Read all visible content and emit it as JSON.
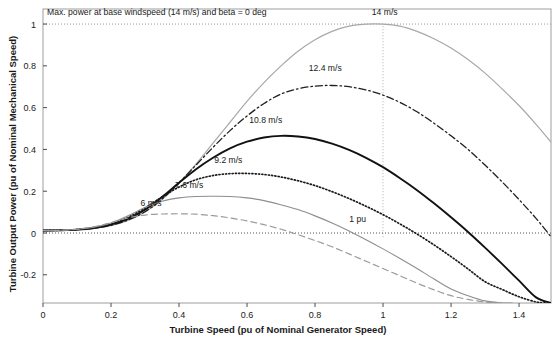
{
  "chart_data": {
    "type": "line",
    "title": "",
    "xlabel": "Turbine Speed (pu of Nominal Generator Speed)",
    "ylabel": "Turbine Output Power (pu of Nominal Mechanical Speed)",
    "xlim": [
      0,
      1.494
    ],
    "ylim": [
      -0.335,
      1.072
    ],
    "xticks": [
      0,
      0.2,
      0.4,
      0.6,
      0.8,
      1,
      1.2,
      1.4
    ],
    "xticklabels": [
      "0",
      "0.2",
      "0.4",
      "0.6",
      "0.8",
      "1",
      "1.2",
      "1.4"
    ],
    "yticks": [
      -0.2,
      0,
      0.2,
      0.4,
      0.6,
      0.8,
      1
    ],
    "yticklabels": [
      "-0.2",
      "0",
      "0.2",
      "0.4",
      "0.6",
      "0.8",
      "1"
    ],
    "grid": false,
    "legend_position": "inline-curve-labels",
    "annotations": [
      {
        "name": "max-power-note",
        "text": "Max. power at base windspeed (14 m/s) and beta = 0 deg",
        "x": 0.012,
        "y": 1.045,
        "anchor": "start"
      },
      {
        "name": "one-pu-note",
        "text": "1 pu",
        "x": 0.95,
        "y": 0.055,
        "anchor": "end"
      }
    ],
    "reference_lines": [
      {
        "name": "max-power-hline",
        "orientation": "horizontal",
        "value": 1.0,
        "style": "dotted",
        "color": "#9a9a9a"
      },
      {
        "name": "base-speed-vline",
        "orientation": "vertical",
        "value": 1.0,
        "style": "dotted",
        "color": "#b0b0b0",
        "y_from": -0.02,
        "y_to": 1.0
      },
      {
        "name": "zero-power-hline",
        "orientation": "horizontal",
        "value": 0.0,
        "style": "dotted",
        "color": "#555555"
      }
    ],
    "series": [
      {
        "name": "14 m/s",
        "label": "14 m/s",
        "label_x": 1.005,
        "label_y": 1.045,
        "color": "#a8a8a8",
        "style": "solid",
        "width": 1.2,
        "peak_x": 1.0,
        "peak_y": 1.0,
        "x": [
          0,
          0.05,
          0.1,
          0.15,
          0.2,
          0.25,
          0.3,
          0.35,
          0.4,
          0.45,
          0.5,
          0.55,
          0.6,
          0.65,
          0.7,
          0.75,
          0.8,
          0.85,
          0.9,
          0.95,
          1.0,
          1.05,
          1.1,
          1.15,
          1.2,
          1.25,
          1.3,
          1.35,
          1.4,
          1.45,
          1.494
        ],
        "y": [
          0.012,
          0.013,
          0.016,
          0.022,
          0.035,
          0.06,
          0.1,
          0.16,
          0.24,
          0.33,
          0.43,
          0.53,
          0.63,
          0.72,
          0.8,
          0.87,
          0.925,
          0.965,
          0.99,
          1.0,
          1.0,
          0.99,
          0.965,
          0.93,
          0.885,
          0.83,
          0.765,
          0.69,
          0.61,
          0.52,
          0.435
        ]
      },
      {
        "name": "12.4 m/s",
        "label": "12.4 m/s",
        "label_x": 0.83,
        "label_y": 0.775,
        "color": "#1f1f1f",
        "style": "dashdot",
        "width": 1.3,
        "peak_x": 0.875,
        "peak_y": 0.705,
        "x": [
          0,
          0.05,
          0.1,
          0.15,
          0.2,
          0.25,
          0.3,
          0.35,
          0.4,
          0.45,
          0.5,
          0.55,
          0.6,
          0.65,
          0.7,
          0.75,
          0.8,
          0.85,
          0.9,
          0.95,
          1.0,
          1.05,
          1.1,
          1.15,
          1.2,
          1.25,
          1.3,
          1.35,
          1.4,
          1.45,
          1.494
        ],
        "y": [
          0.012,
          0.013,
          0.016,
          0.023,
          0.037,
          0.062,
          0.102,
          0.162,
          0.24,
          0.325,
          0.41,
          0.49,
          0.56,
          0.62,
          0.665,
          0.69,
          0.703,
          0.706,
          0.7,
          0.685,
          0.66,
          0.625,
          0.58,
          0.525,
          0.465,
          0.4,
          0.325,
          0.245,
          0.16,
          0.07,
          -0.018
        ]
      },
      {
        "name": "10.8 m/s",
        "label": "10.8 m/s",
        "label_x": 0.655,
        "label_y": 0.525,
        "color": "#111111",
        "style": "solid",
        "width": 1.9,
        "peak_x": 0.72,
        "peak_y": 0.465,
        "x": [
          0,
          0.05,
          0.1,
          0.15,
          0.2,
          0.25,
          0.3,
          0.35,
          0.4,
          0.45,
          0.5,
          0.55,
          0.6,
          0.65,
          0.7,
          0.75,
          0.8,
          0.85,
          0.9,
          0.95,
          1.0,
          1.05,
          1.1,
          1.15,
          1.2,
          1.25,
          1.3,
          1.35,
          1.4,
          1.45,
          1.494
        ],
        "y": [
          0.012,
          0.013,
          0.016,
          0.024,
          0.04,
          0.068,
          0.112,
          0.172,
          0.24,
          0.305,
          0.36,
          0.405,
          0.437,
          0.457,
          0.465,
          0.462,
          0.45,
          0.428,
          0.398,
          0.36,
          0.315,
          0.262,
          0.205,
          0.142,
          0.075,
          0.005,
          -0.07,
          -0.148,
          -0.228,
          -0.308,
          -0.335
        ]
      },
      {
        "name": "9.2 m/s",
        "label": "9.2 m/s",
        "label_x": 0.545,
        "label_y": 0.335,
        "color": "#1a1a1a",
        "style": "dotted",
        "width": 1.7,
        "peak_x": 0.615,
        "peak_y": 0.285,
        "x": [
          0,
          0.05,
          0.1,
          0.15,
          0.2,
          0.25,
          0.3,
          0.35,
          0.4,
          0.45,
          0.5,
          0.55,
          0.6,
          0.65,
          0.7,
          0.75,
          0.8,
          0.85,
          0.9,
          0.95,
          1.0,
          1.05,
          1.1,
          1.15,
          1.2,
          1.25,
          1.3,
          1.35,
          1.4,
          1.45,
          1.478
        ],
        "y": [
          0.012,
          0.013,
          0.017,
          0.026,
          0.044,
          0.075,
          0.12,
          0.172,
          0.22,
          0.255,
          0.275,
          0.284,
          0.285,
          0.28,
          0.268,
          0.25,
          0.227,
          0.198,
          0.165,
          0.128,
          0.088,
          0.043,
          -0.005,
          -0.057,
          -0.113,
          -0.172,
          -0.233,
          -0.27,
          -0.305,
          -0.33,
          -0.335
        ]
      },
      {
        "name": "7.6 m/s",
        "label": "7.6 m/s",
        "label_x": 0.43,
        "label_y": 0.215,
        "color": "#8e8e8e",
        "style": "solid",
        "width": 1.1,
        "peak_x": 0.535,
        "peak_y": 0.175,
        "x": [
          0,
          0.05,
          0.1,
          0.15,
          0.2,
          0.25,
          0.3,
          0.35,
          0.4,
          0.45,
          0.5,
          0.55,
          0.6,
          0.65,
          0.7,
          0.75,
          0.8,
          0.85,
          0.9,
          0.95,
          1.0,
          1.05,
          1.1,
          1.15,
          1.2,
          1.25,
          1.3,
          1.35,
          1.38
        ],
        "y": [
          0.012,
          0.013,
          0.018,
          0.028,
          0.048,
          0.082,
          0.122,
          0.152,
          0.168,
          0.175,
          0.176,
          0.175,
          0.168,
          0.155,
          0.135,
          0.112,
          0.082,
          0.048,
          0.01,
          -0.032,
          -0.076,
          -0.122,
          -0.17,
          -0.22,
          -0.268,
          -0.3,
          -0.325,
          -0.335,
          -0.335
        ]
      },
      {
        "name": "6 m/s",
        "label": "6 m/s",
        "label_x": 0.318,
        "label_y": 0.128,
        "color": "#9b9b9b",
        "style": "dashed",
        "width": 1.2,
        "peak_x": 0.44,
        "peak_y": 0.092,
        "x": [
          0,
          0.05,
          0.1,
          0.15,
          0.2,
          0.25,
          0.3,
          0.35,
          0.4,
          0.45,
          0.5,
          0.55,
          0.6,
          0.65,
          0.7,
          0.75,
          0.8,
          0.85,
          0.9,
          0.95,
          1.0,
          1.05,
          1.1,
          1.15,
          1.2,
          1.25,
          1.3,
          1.35,
          1.4,
          1.45,
          1.478
        ],
        "y": [
          0.012,
          0.013,
          0.018,
          0.03,
          0.05,
          0.072,
          0.086,
          0.091,
          0.092,
          0.09,
          0.083,
          0.072,
          0.058,
          0.04,
          0.018,
          -0.008,
          -0.036,
          -0.066,
          -0.1,
          -0.135,
          -0.17,
          -0.205,
          -0.24,
          -0.272,
          -0.3,
          -0.318,
          -0.33,
          -0.336,
          -0.34,
          -0.34,
          -0.338
        ]
      }
    ]
  },
  "plot_geometry": {
    "left": 43,
    "right": 551,
    "top": 9,
    "bottom": 303
  }
}
